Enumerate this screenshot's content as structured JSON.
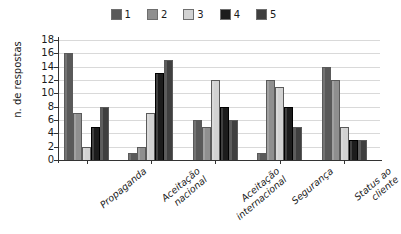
{
  "chart_data": {
    "type": "bar",
    "title": "",
    "subtitle": "",
    "xlabel": "",
    "ylabel": "n. de respostas",
    "ylim": [
      0,
      18
    ],
    "ytick_step": 2,
    "yticks": [
      0,
      2,
      4,
      6,
      8,
      10,
      12,
      14,
      16,
      18
    ],
    "grid": true,
    "legend_position": "top-center",
    "categories": [
      "Propaganda",
      "Aceitação nacional",
      "Aceitação internacional",
      "Segurança",
      "Status ao cliente"
    ],
    "category_lines": [
      [
        "Propaganda"
      ],
      [
        "Aceitação",
        "nacional"
      ],
      [
        "Aceitação",
        "internacional"
      ],
      [
        "Segurança"
      ],
      [
        "Status ao",
        "cliente"
      ]
    ],
    "series": [
      {
        "name": "1",
        "color": "#595959",
        "values": [
          16,
          1,
          6,
          1,
          14
        ]
      },
      {
        "name": "2",
        "color": "#8f8f8f",
        "values": [
          7,
          2,
          5,
          12,
          12
        ]
      },
      {
        "name": "3",
        "color": "#d2d2d2",
        "values": [
          2,
          7,
          12,
          11,
          5
        ]
      },
      {
        "name": "4",
        "color": "#1c1c1c",
        "values": [
          5,
          13,
          8,
          8,
          3
        ]
      },
      {
        "name": "5",
        "color": "#3f3f3f",
        "values": [
          8,
          15,
          6,
          5,
          3
        ]
      }
    ]
  },
  "legend": {
    "entries": [
      {
        "label": "1"
      },
      {
        "label": "2"
      },
      {
        "label": "3"
      },
      {
        "label": "4"
      },
      {
        "label": "5"
      }
    ]
  },
  "colors": {
    "series_1": "#595959",
    "series_2": "#8f8f8f",
    "series_3": "#d2d2d2",
    "series_4": "#1c1c1c",
    "series_5": "#3f3f3f",
    "axis": "#333333",
    "grid": "#d9d9d9",
    "text": "#1a1a1a",
    "background": "#ffffff"
  }
}
